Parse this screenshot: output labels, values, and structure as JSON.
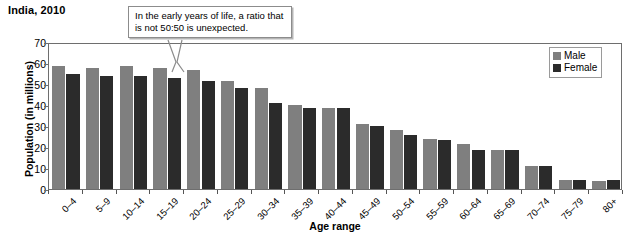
{
  "chart_title": "India, 2010",
  "axis": {
    "x_title": "Age range",
    "y_title": "Population (in millions)"
  },
  "legend": {
    "male_label": "Male",
    "female_label": "Female",
    "male_color": "#7f7f7f",
    "female_color": "#2b2b2b"
  },
  "callout": {
    "text": "In the early years of life, a ratio that is not 50:50 is unexpected."
  },
  "chart_data": {
    "type": "bar",
    "title": "India, 2010",
    "xlabel": "Age range",
    "ylabel": "Population (in millions)",
    "ylim": [
      0,
      70
    ],
    "yticks": [
      0,
      10,
      20,
      30,
      40,
      50,
      60,
      70
    ],
    "grid": false,
    "legend_position": "top-right",
    "categories": [
      "0–4",
      "5–9",
      "10–14",
      "15–19",
      "20–24",
      "25–29",
      "30–34",
      "35–39",
      "40–44",
      "45–49",
      "50–54",
      "55–59",
      "60–64",
      "65–69",
      "70–74",
      "75–79",
      "80+"
    ],
    "series": [
      {
        "name": "Male",
        "color": "#7f7f7f",
        "values": [
          58.5,
          57.5,
          58.5,
          57.5,
          56.5,
          51.5,
          48,
          40,
          38.5,
          31,
          28,
          24,
          21.5,
          18.5,
          11,
          4.5,
          4
        ]
      },
      {
        "name": "Female",
        "color": "#2b2b2b",
        "values": [
          55,
          54,
          54,
          53,
          51.5,
          48,
          41,
          38.5,
          38.5,
          30,
          25.5,
          23.5,
          18.5,
          18.5,
          11,
          4.5,
          4.5
        ]
      }
    ]
  }
}
